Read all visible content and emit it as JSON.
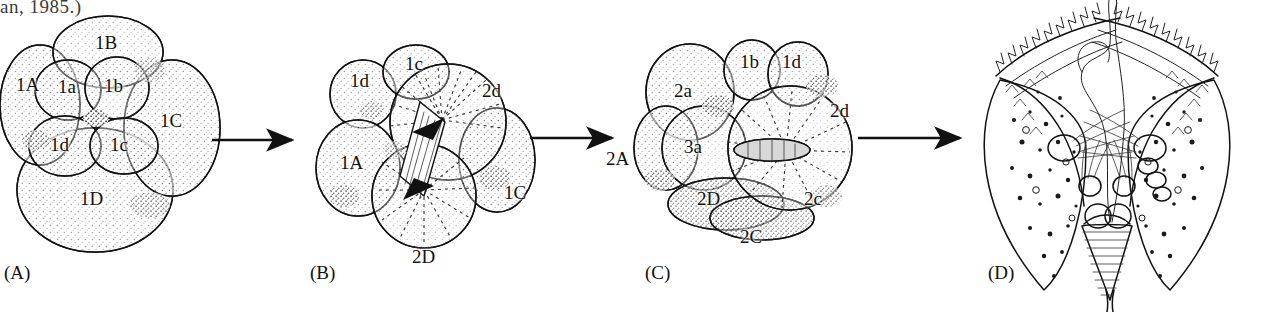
{
  "figure": {
    "kind": "spiralian-cleavage-diagram",
    "caption_fragment": "an, 1985.)",
    "background_color": "#ffffff",
    "ink_color": "#111111"
  },
  "panels": [
    {
      "id": "A",
      "letter": "(A)",
      "description": "Early spiral-cleavage embryo, first quartet of micromeres",
      "cell_labels": [
        {
          "text": "1B",
          "x": 95,
          "y": 32
        },
        {
          "text": "1A",
          "x": 16,
          "y": 74
        },
        {
          "text": "1a",
          "x": 58,
          "y": 76
        },
        {
          "text": "1b",
          "x": 104,
          "y": 75
        },
        {
          "text": "1C",
          "x": 160,
          "y": 110
        },
        {
          "text": "1d",
          "x": 50,
          "y": 134
        },
        {
          "text": "1c",
          "x": 110,
          "y": 134
        },
        {
          "text": "1D",
          "x": 80,
          "y": 188
        }
      ]
    },
    {
      "id": "B",
      "letter": "(B)",
      "description": "Embryo with mitotic spindle in the 2D macromere",
      "cell_labels": [
        {
          "text": "1d",
          "x": 350,
          "y": 70
        },
        {
          "text": "1c",
          "x": 405,
          "y": 53
        },
        {
          "text": "2d",
          "x": 482,
          "y": 80
        },
        {
          "text": "1A",
          "x": 340,
          "y": 152
        },
        {
          "text": "1C",
          "x": 504,
          "y": 182
        },
        {
          "text": "2D",
          "x": 412,
          "y": 246
        }
      ]
    },
    {
      "id": "C",
      "letter": "(C)",
      "description": "Later embryo with second and third quartet cells",
      "cell_labels": [
        {
          "text": "2a",
          "x": 674,
          "y": 80
        },
        {
          "text": "1b",
          "x": 740,
          "y": 51
        },
        {
          "text": "1d",
          "x": 782,
          "y": 51
        },
        {
          "text": "2d",
          "x": 830,
          "y": 100
        },
        {
          "text": "2A",
          "x": 606,
          "y": 148
        },
        {
          "text": "3a",
          "x": 684,
          "y": 136
        },
        {
          "text": "2D",
          "x": 697,
          "y": 188
        },
        {
          "text": "2c",
          "x": 804,
          "y": 188
        },
        {
          "text": "2C",
          "x": 740,
          "y": 226
        }
      ]
    },
    {
      "id": "D",
      "letter": "(D)",
      "description": "Trochophore-type larva with ciliated bands and apical tuft",
      "cell_labels": []
    }
  ],
  "panel_letters": [
    {
      "text": "(A)",
      "x": 4,
      "y": 262
    },
    {
      "text": "(B)",
      "x": 310,
      "y": 262
    },
    {
      "text": "(C)",
      "x": 645,
      "y": 262
    },
    {
      "text": "(D)",
      "x": 988,
      "y": 262
    }
  ],
  "arrows": [
    {
      "name": "arrow-a-to-b",
      "x1": 212,
      "y1": 140,
      "x2": 296,
      "y2": 140
    },
    {
      "name": "arrow-b-to-c",
      "x1": 530,
      "y1": 138,
      "x2": 616,
      "y2": 138
    },
    {
      "name": "arrow-c-to-d",
      "x1": 858,
      "y1": 138,
      "x2": 964,
      "y2": 138
    }
  ]
}
